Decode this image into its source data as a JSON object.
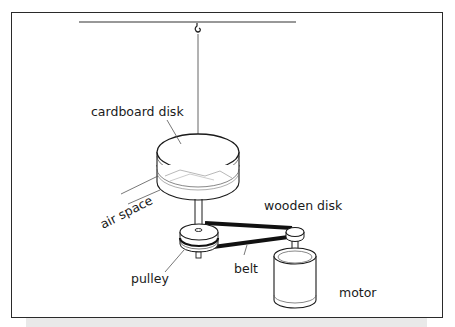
{
  "diagram": {
    "labels": {
      "cardboard_disk": "cardboard disk",
      "air_space": "air space",
      "wooden_disk": "wooden disk",
      "pulley": "pulley",
      "belt": "belt",
      "motor": "motor"
    },
    "components": [
      "ceiling-bar",
      "hook",
      "suspension-thread",
      "cardboard-disk",
      "air-space",
      "wooden-disk",
      "shaft",
      "pulley",
      "belt",
      "motor-pulley",
      "motor"
    ],
    "colors": {
      "line": "#1a1a1a",
      "frame": "#2a2a2a",
      "shadow": "#e9e9e9",
      "background": "#ffffff"
    }
  }
}
